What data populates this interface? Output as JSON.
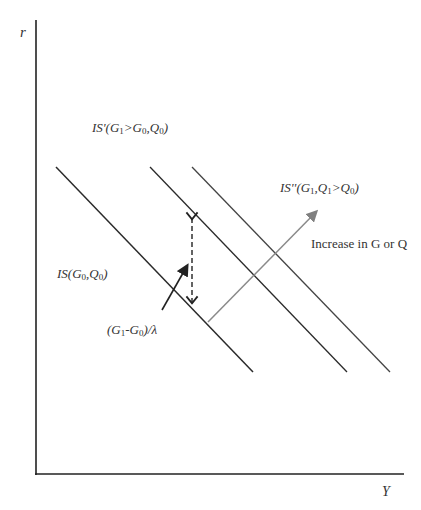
{
  "axes": {
    "y_label": "r",
    "x_label": "Y"
  },
  "curves": [
    {
      "name": "IS",
      "label_main": "IS",
      "label_args": "(G0,Q0)"
    },
    {
      "name": "IS'",
      "label_main": "IS'",
      "label_args": "(G1>G0,Q0)"
    },
    {
      "name": "IS''",
      "label_main": "IS''",
      "label_args": "(G1,Q1>Q0)"
    }
  ],
  "annotations": {
    "shift_arrow": "Increase in G or Q",
    "multiplier": "(G1-G0)/λ"
  },
  "colors": {
    "axis": "#222222",
    "curve": "#2a2a2a",
    "shift_arrow": "#8a8a8a"
  }
}
